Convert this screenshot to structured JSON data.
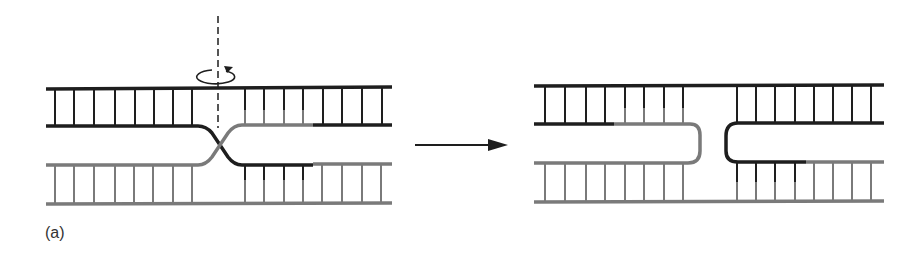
{
  "figure": {
    "panel_label": "(a)",
    "colors": {
      "dark_strand": "#1e1e1e",
      "light_strand": "#7a7a7a",
      "background": "#ffffff"
    },
    "left_panel": {
      "name": "crossed-strand junction",
      "rotation_axis": "dashed vertical line",
      "rotation_icon": "circular-arrow-icon"
    },
    "transition": {
      "arrow": "right-arrow-icon"
    },
    "right_panel": {
      "name": "open uncrossed junction"
    }
  }
}
